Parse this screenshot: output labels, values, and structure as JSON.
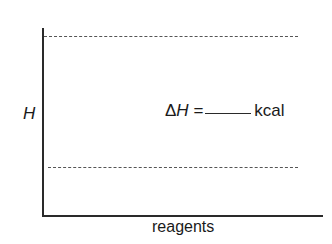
{
  "diagram": {
    "y_axis_label": "H",
    "x_axis_label": "reagents",
    "equation": {
      "delta": "Δ",
      "symbol": "H",
      "equals": "=",
      "blank": "",
      "unit": "kcal"
    },
    "levels": [
      {
        "name": "upper-level",
        "style": "dashed"
      },
      {
        "name": "lower-level",
        "style": "dashed"
      }
    ]
  }
}
